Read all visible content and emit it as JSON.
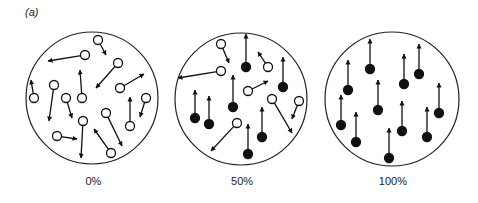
{
  "panel_label": "(a)",
  "colors": {
    "stroke": "#111111",
    "fill_aligned": "#111111",
    "fill_random": "#ffffff"
  },
  "panels": [
    {
      "label": "0%",
      "center": [
        92,
        98
      ],
      "radius": 66,
      "spins": [
        {
          "x": 98,
          "y": 40,
          "dx": 8,
          "dy": 15,
          "filled": false
        },
        {
          "x": 85,
          "y": 55,
          "dx": -37,
          "dy": 6,
          "filled": false
        },
        {
          "x": 118,
          "y": 63,
          "dx": -22,
          "dy": 25,
          "filled": false
        },
        {
          "x": 120,
          "y": 88,
          "dx": 24,
          "dy": -14,
          "filled": false
        },
        {
          "x": 34,
          "y": 98,
          "dx": -3,
          "dy": -18,
          "filled": false
        },
        {
          "x": 54,
          "y": 85,
          "dx": -5,
          "dy": 36,
          "filled": false
        },
        {
          "x": 66,
          "y": 98,
          "dx": 6,
          "dy": 20,
          "filled": false
        },
        {
          "x": 82,
          "y": 98,
          "dx": -2,
          "dy": -28,
          "filled": false
        },
        {
          "x": 146,
          "y": 98,
          "dx": -6,
          "dy": 19,
          "filled": false
        },
        {
          "x": 106,
          "y": 113,
          "dx": 16,
          "dy": 33,
          "filled": false
        },
        {
          "x": 130,
          "y": 126,
          "dx": 0,
          "dy": -29,
          "filled": false
        },
        {
          "x": 57,
          "y": 136,
          "dx": 20,
          "dy": 3,
          "filled": false
        },
        {
          "x": 83,
          "y": 121,
          "dx": -2,
          "dy": 37,
          "filled": false
        },
        {
          "x": 111,
          "y": 153,
          "dx": -17,
          "dy": -24,
          "filled": false
        }
      ]
    },
    {
      "label": "50%",
      "center": [
        241,
        99
      ],
      "radius": 66,
      "spins": [
        {
          "x": 221,
          "y": 44,
          "dx": 8,
          "dy": 19,
          "filled": false
        },
        {
          "x": 246,
          "y": 67,
          "dx": 0,
          "dy": -33,
          "filled": true
        },
        {
          "x": 268,
          "y": 67,
          "dx": -10,
          "dy": -15,
          "filled": false
        },
        {
          "x": 221,
          "y": 71,
          "dx": -43,
          "dy": 7,
          "filled": false
        },
        {
          "x": 283,
          "y": 87,
          "dx": 0,
          "dy": -30,
          "filled": true
        },
        {
          "x": 195,
          "y": 118,
          "dx": 0,
          "dy": -28,
          "filled": true
        },
        {
          "x": 209,
          "y": 124,
          "dx": 0,
          "dy": -28,
          "filled": true
        },
        {
          "x": 233,
          "y": 107,
          "dx": 0,
          "dy": -32,
          "filled": true
        },
        {
          "x": 248,
          "y": 91,
          "dx": 20,
          "dy": -10,
          "filled": false
        },
        {
          "x": 272,
          "y": 99,
          "dx": 20,
          "dy": 34,
          "filled": false
        },
        {
          "x": 299,
          "y": 101,
          "dx": -7,
          "dy": 18,
          "filled": false
        },
        {
          "x": 237,
          "y": 123,
          "dx": -26,
          "dy": 28,
          "filled": false
        },
        {
          "x": 262,
          "y": 137,
          "dx": 0,
          "dy": -30,
          "filled": true
        },
        {
          "x": 248,
          "y": 154,
          "dx": 0,
          "dy": -30,
          "filled": true
        }
      ]
    },
    {
      "label": "100%",
      "center": [
        392,
        99
      ],
      "radius": 67,
      "spins": [
        {
          "x": 370,
          "y": 69,
          "dx": 0,
          "dy": -30,
          "filled": true
        },
        {
          "x": 348,
          "y": 90,
          "dx": 0,
          "dy": -30,
          "filled": true
        },
        {
          "x": 404,
          "y": 84,
          "dx": 0,
          "dy": -30,
          "filled": true
        },
        {
          "x": 419,
          "y": 74,
          "dx": 0,
          "dy": -30,
          "filled": true
        },
        {
          "x": 378,
          "y": 110,
          "dx": 0,
          "dy": -30,
          "filled": true
        },
        {
          "x": 439,
          "y": 113,
          "dx": 0,
          "dy": -30,
          "filled": true
        },
        {
          "x": 341,
          "y": 125,
          "dx": 0,
          "dy": -30,
          "filled": true
        },
        {
          "x": 356,
          "y": 142,
          "dx": 0,
          "dy": -30,
          "filled": true
        },
        {
          "x": 402,
          "y": 131,
          "dx": 0,
          "dy": -30,
          "filled": true
        },
        {
          "x": 427,
          "y": 137,
          "dx": 0,
          "dy": -30,
          "filled": true
        },
        {
          "x": 389,
          "y": 158,
          "dx": 0,
          "dy": -30,
          "filled": true
        }
      ]
    }
  ]
}
